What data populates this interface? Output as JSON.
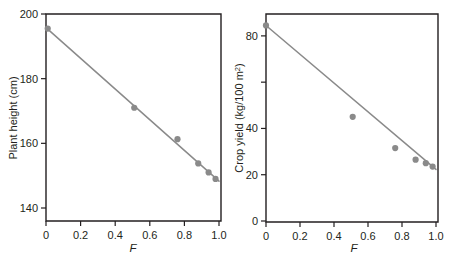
{
  "figure": {
    "background": "#ffffff",
    "axis_color": "#231f20",
    "marker_color": "#8a8a8a",
    "line_color": "#8a8a8a"
  },
  "chart_data": [
    {
      "type": "scatter",
      "panel": "left",
      "title": "",
      "xlabel": "F",
      "ylabel": "Plant height (cm)",
      "xlim": [
        0,
        1.0
      ],
      "ylim": [
        138,
        200
      ],
      "grid": false,
      "legend": null,
      "xticks": [
        0,
        0.2,
        0.4,
        0.6,
        0.8,
        1.0
      ],
      "xticklabels": [
        "0",
        "0.2",
        "0.4",
        "0.6",
        "0.8",
        "1.0"
      ],
      "yticks": [
        140,
        160,
        180,
        200
      ],
      "yticklabels": [
        "140",
        "160",
        "180",
        "200"
      ],
      "x": [
        0.01,
        0.51,
        0.76,
        0.88,
        0.94,
        0.98
      ],
      "y": [
        195.5,
        171.0,
        161.3,
        153.8,
        151.0,
        149.0
      ],
      "series": [
        {
          "name": "Plant height",
          "x": [
            0.01,
            0.51,
            0.76,
            0.88,
            0.94,
            0.98
          ],
          "values": [
            195.5,
            171.0,
            161.3,
            153.8,
            151.0,
            149.0
          ]
        }
      ],
      "fit_line": {
        "type": "linear",
        "x": [
          0.0,
          1.0
        ],
        "y": [
          195.8,
          148.3
        ]
      }
    },
    {
      "type": "scatter",
      "panel": "right",
      "title": "",
      "xlabel": "F",
      "ylabel": "Crop yield (kg/100 m2)",
      "ylabel_base": "Crop yield (kg/100 m",
      "ylabel_sup": "2",
      "ylabel_tail": ")",
      "xlim": [
        0,
        1.0
      ],
      "ylim": [
        0,
        86
      ],
      "grid": false,
      "legend": null,
      "xticks": [
        0,
        0.2,
        0.4,
        0.6,
        0.8,
        1.0
      ],
      "xticklabels": [
        "0",
        "0.2",
        "0.4",
        "0.6",
        "0.8",
        "1.0"
      ],
      "yticks": [
        0,
        20,
        40,
        60,
        80
      ],
      "yticklabels": [
        "0",
        "20",
        "40",
        "",
        "80"
      ],
      "x": [
        0.0,
        0.51,
        0.76,
        0.88,
        0.94,
        0.98
      ],
      "y": [
        84.5,
        45.0,
        31.5,
        26.5,
        25.0,
        23.5
      ],
      "series": [
        {
          "name": "Crop yield",
          "x": [
            0.0,
            0.51,
            0.76,
            0.88,
            0.94,
            0.98
          ],
          "values": [
            84.5,
            45.0,
            31.5,
            26.5,
            25.0,
            23.5
          ]
        }
      ],
      "fit_line": {
        "type": "linear",
        "x": [
          0.0,
          1.0
        ],
        "y": [
          84.5,
          22.3
        ]
      }
    }
  ]
}
